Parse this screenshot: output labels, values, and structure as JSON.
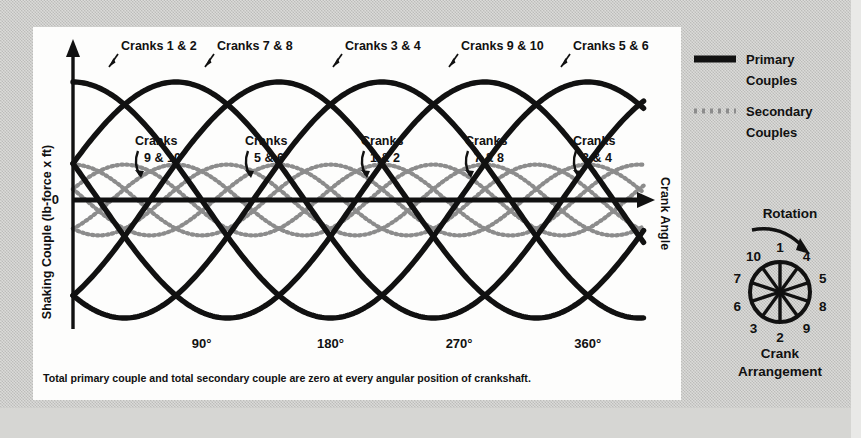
{
  "figure": {
    "caption": "Total primary couple and total secondary couple are zero at every angular position of crankshaft.",
    "y_axis_title": "Shaking Couple (lb-force x ft)",
    "x_axis_title": "Crank Angle",
    "zero_tick": "0"
  },
  "legend": {
    "items": [
      {
        "label_line1": "Primary",
        "label_line2": "Couples",
        "style": "solid-thick",
        "color": "#111111"
      },
      {
        "label_line1": "Secondary",
        "label_line2": "Couples",
        "style": "dotted",
        "color": "#8c8c8c"
      }
    ]
  },
  "crank_arrangement": {
    "rotation_label": "Rotation",
    "title_line1": "Crank",
    "title_line2": "Arrangement",
    "spokes": [
      {
        "label": "1",
        "angle_deg": 0
      },
      {
        "label": "4",
        "angle_deg": 36
      },
      {
        "label": "5",
        "angle_deg": 72
      },
      {
        "label": "8",
        "angle_deg": 108
      },
      {
        "label": "9",
        "angle_deg": 144
      },
      {
        "label": "2",
        "angle_deg": 180
      },
      {
        "label": "3",
        "angle_deg": 216
      },
      {
        "label": "6",
        "angle_deg": 252
      },
      {
        "label": "7",
        "angle_deg": 288
      },
      {
        "label": "10",
        "angle_deg": 324
      }
    ]
  },
  "chart_data": {
    "type": "line",
    "title": "",
    "xlabel": "Crank Angle",
    "ylabel": "Shaking Couple (lb-force x ft)",
    "xlim": [
      0,
      400
    ],
    "ylim": [
      -1.15,
      1.15
    ],
    "xticks": [
      90,
      180,
      270,
      360
    ],
    "xtick_labels": [
      "90°",
      "180°",
      "270°",
      "360°"
    ],
    "yticks": [
      0
    ],
    "ytick_labels": [
      "0"
    ],
    "grid": false,
    "legend_position": "right-outside",
    "annotation_note": "Five primary couple curves (order 1, period 360°) and five secondary couple curves (order 2, period 180°); each pair of cranks is phase shifted by 72° so the totals sum to zero.",
    "primary": {
      "name": "Primary Couples",
      "style": "solid-thick",
      "color": "#111111",
      "order": 1,
      "period_deg": 360,
      "amplitude": 1.0,
      "series": [
        {
          "name": "Cranks 1 & 2",
          "phase_deg": 0,
          "label_position": "top"
        },
        {
          "name": "Cranks 7 & 8",
          "phase_deg": 72,
          "label_position": "top"
        },
        {
          "name": "Cranks 3 & 4",
          "phase_deg": 144,
          "label_position": "top"
        },
        {
          "name": "Cranks 9 & 10",
          "phase_deg": 216,
          "label_position": "top"
        },
        {
          "name": "Cranks 5 & 6",
          "phase_deg": 288,
          "label_position": "top"
        }
      ]
    },
    "secondary": {
      "name": "Secondary Couples",
      "style": "dotted",
      "color": "#8c8c8c",
      "order": 2,
      "period_deg": 180,
      "amplitude": 0.3,
      "series": [
        {
          "name": "Cranks 9 & 10",
          "phase_deg": 0,
          "label_position": "inner"
        },
        {
          "name": "Cranks 5 & 6",
          "phase_deg": 144,
          "label_position": "inner"
        },
        {
          "name": "Cranks 1 & 2",
          "phase_deg": 288,
          "label_position": "inner"
        },
        {
          "name": "Cranks 7 & 8",
          "phase_deg": 72,
          "label_position": "inner"
        },
        {
          "name": "Cranks 3 & 4",
          "phase_deg": 216,
          "label_position": "inner"
        }
      ]
    },
    "top_labels": [
      {
        "text": "Cranks 1 & 2",
        "x_px": 88,
        "y_px": 23,
        "arrow_to_x": 76,
        "arrow_to_y": 40
      },
      {
        "text": "Cranks 7 & 8",
        "x_px": 184,
        "y_px": 23,
        "arrow_to_x": 172,
        "arrow_to_y": 40
      },
      {
        "text": "Cranks 3 & 4",
        "x_px": 312,
        "y_px": 23,
        "arrow_to_x": 300,
        "arrow_to_y": 40
      },
      {
        "text": "Cranks 9 & 10",
        "x_px": 428,
        "y_px": 23,
        "arrow_to_x": 416,
        "arrow_to_y": 40
      },
      {
        "text": "Cranks 5 & 6",
        "x_px": 540,
        "y_px": 23,
        "arrow_to_x": 528,
        "arrow_to_y": 40
      }
    ],
    "inner_labels": [
      {
        "line1": "Cranks",
        "line2": "9 & 10",
        "x_px": 102,
        "y_px": 118
      },
      {
        "line1": "Cranks",
        "line2": "5 & 6",
        "x_px": 212,
        "y_px": 118
      },
      {
        "line1": "Cranks",
        "line2": "1 & 2",
        "x_px": 328,
        "y_px": 118
      },
      {
        "line1": "Cranks",
        "line2": "7 & 8",
        "x_px": 432,
        "y_px": 118
      },
      {
        "line1": "Cranks",
        "line2": "3 & 4",
        "x_px": 540,
        "y_px": 118
      }
    ]
  }
}
